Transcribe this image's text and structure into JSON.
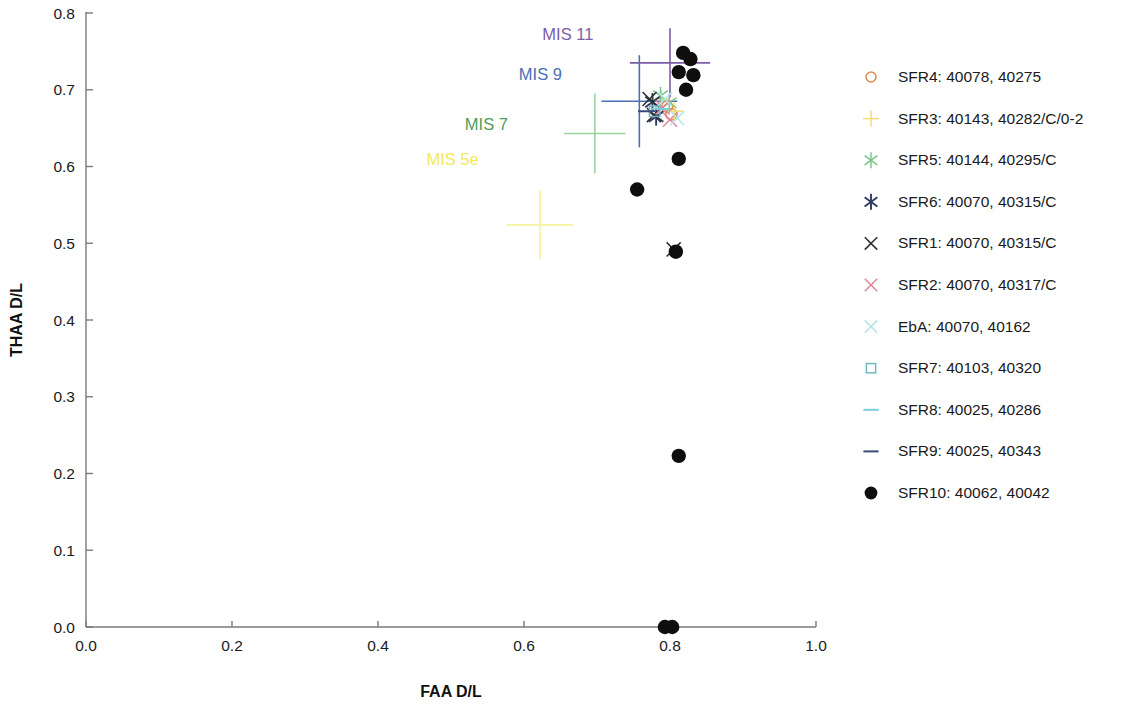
{
  "chart_data": {
    "type": "scatter",
    "title": "",
    "xlabel": "FAA D/L",
    "ylabel": "THAA D/L",
    "xlim": [
      0.0,
      1.0
    ],
    "ylim": [
      0.0,
      0.8
    ],
    "xticks": [
      "0.0",
      "0.2",
      "0.4",
      "0.6",
      "0.8",
      "1.0"
    ],
    "xtick_values": [
      0.0,
      0.2,
      0.4,
      0.6,
      0.8,
      1.0
    ],
    "yticks": [
      "0.0",
      "0.1",
      "0.2",
      "0.3",
      "0.4",
      "0.5",
      "0.6",
      "0.7",
      "0.8"
    ],
    "ytick_values": [
      0.0,
      0.1,
      0.2,
      0.3,
      0.4,
      0.5,
      0.6,
      0.7,
      0.8
    ],
    "grid": false,
    "legend_position": "right",
    "annotations": [
      {
        "text": "MIS 11",
        "x": 0.695,
        "y": 0.765,
        "color": "#7b5ea7",
        "anchor": "end"
      },
      {
        "text": "MIS 9",
        "x": 0.652,
        "y": 0.713,
        "color": "#4a6fb5",
        "anchor": "end"
      },
      {
        "text": "MIS 7",
        "x": 0.578,
        "y": 0.647,
        "color": "#4f9c5a",
        "anchor": "end"
      },
      {
        "text": "MIS 5e",
        "x": 0.538,
        "y": 0.602,
        "color": "#f2e85c",
        "anchor": "end"
      }
    ],
    "error_crosses": [
      {
        "name": "MIS 11",
        "color": "#7b5ea7",
        "x": 0.8,
        "y": 0.735,
        "xerr": 0.055,
        "yerr": 0.045
      },
      {
        "name": "MIS 9",
        "color": "#4a6fb5",
        "x": 0.758,
        "y": 0.685,
        "xerr": 0.052,
        "yerr": 0.06
      },
      {
        "name": "MIS 7",
        "color": "#9bd4a0",
        "x": 0.697,
        "y": 0.643,
        "xerr": 0.042,
        "yerr": 0.052
      },
      {
        "name": "MIS 5e",
        "color": "#f7f2a0",
        "x": 0.622,
        "y": 0.524,
        "xerr": 0.046,
        "yerr": 0.045
      }
    ],
    "series": [
      {
        "name": "SFR4: 40078, 40275",
        "marker": "circle-open",
        "color": "#e08a4a",
        "points": [
          {
            "x": 0.796,
            "y": 0.678
          },
          {
            "x": 0.802,
            "y": 0.668
          }
        ]
      },
      {
        "name": "SFR3: 40143, 40282/C/0-2",
        "marker": "plus",
        "color": "#f2dd7a",
        "points": [
          {
            "x": 0.788,
            "y": 0.688
          },
          {
            "x": 0.806,
            "y": 0.672
          }
        ]
      },
      {
        "name": "SFR5: 40144, 40295/C",
        "marker": "asterisk",
        "color": "#7bc48a",
        "points": [
          {
            "x": 0.787,
            "y": 0.692
          },
          {
            "x": 0.799,
            "y": 0.683
          }
        ]
      },
      {
        "name": "SFR6: 40070, 40315/C",
        "marker": "asterisk-dark",
        "color": "#2e3b63",
        "points": [
          {
            "x": 0.776,
            "y": 0.684
          },
          {
            "x": 0.781,
            "y": 0.665
          }
        ]
      },
      {
        "name": "SFR1: 40070, 40315/C",
        "marker": "x",
        "color": "#2b2b2b",
        "points": [
          {
            "x": 0.772,
            "y": 0.688
          },
          {
            "x": 0.778,
            "y": 0.667
          },
          {
            "x": 0.805,
            "y": 0.492
          }
        ]
      },
      {
        "name": "SFR2: 40070, 40317/C",
        "marker": "x",
        "color": "#e0849a",
        "points": [
          {
            "x": 0.79,
            "y": 0.677
          },
          {
            "x": 0.8,
            "y": 0.661
          }
        ]
      },
      {
        "name": "EbA: 40070, 40162",
        "marker": "x",
        "color": "#b6e3e8",
        "points": [
          {
            "x": 0.793,
            "y": 0.688
          },
          {
            "x": 0.81,
            "y": 0.663
          }
        ]
      },
      {
        "name": "SFR7: 40103, 40320",
        "marker": "square-open",
        "color": "#6fb8c4",
        "points": [
          {
            "x": 0.779,
            "y": 0.672
          }
        ]
      },
      {
        "name": "SFR8: 40025, 40286",
        "marker": "dash",
        "color": "#77cfd8",
        "points": [
          {
            "x": 0.787,
            "y": 0.675
          }
        ]
      },
      {
        "name": "SFR9: 40025, 40343",
        "marker": "dash",
        "color": "#3a4a7a",
        "points": [
          {
            "x": 0.768,
            "y": 0.672
          }
        ]
      },
      {
        "name": "SFR10: 40062, 40042",
        "marker": "circle-filled",
        "color": "#100d0d",
        "points": [
          {
            "x": 0.818,
            "y": 0.748
          },
          {
            "x": 0.828,
            "y": 0.74
          },
          {
            "x": 0.812,
            "y": 0.723
          },
          {
            "x": 0.832,
            "y": 0.719
          },
          {
            "x": 0.822,
            "y": 0.7
          },
          {
            "x": 0.812,
            "y": 0.61
          },
          {
            "x": 0.755,
            "y": 0.57
          },
          {
            "x": 0.808,
            "y": 0.489
          },
          {
            "x": 0.812,
            "y": 0.223
          },
          {
            "x": 0.793,
            "y": 0.0
          },
          {
            "x": 0.803,
            "y": 0.0
          }
        ]
      }
    ]
  },
  "legend": {
    "entries": [
      {
        "label": "SFR4: 40078, 40275",
        "marker": "circle-open",
        "color": "#e08a4a"
      },
      {
        "label": "SFR3: 40143, 40282/C/0-2",
        "marker": "plus",
        "color": "#f2dd7a"
      },
      {
        "label": "SFR5: 40144, 40295/C",
        "marker": "asterisk",
        "color": "#7bc48a"
      },
      {
        "label": "SFR6: 40070, 40315/C",
        "marker": "asterisk-dark",
        "color": "#2e3b63"
      },
      {
        "label": "SFR1: 40070, 40315/C",
        "marker": "x",
        "color": "#2b2b2b"
      },
      {
        "label": "SFR2: 40070, 40317/C",
        "marker": "x",
        "color": "#e0849a"
      },
      {
        "label": "EbA: 40070, 40162",
        "marker": "x",
        "color": "#b6e3e8"
      },
      {
        "label": "SFR7: 40103, 40320",
        "marker": "square-open",
        "color": "#6fb8c4"
      },
      {
        "label": "SFR8: 40025, 40286",
        "marker": "dash",
        "color": "#77cfd8"
      },
      {
        "label": "SFR9: 40025, 40343",
        "marker": "dash",
        "color": "#3a4a7a"
      },
      {
        "label": "SFR10: 40062, 40042",
        "marker": "circle-filled",
        "color": "#100d0d"
      }
    ]
  }
}
